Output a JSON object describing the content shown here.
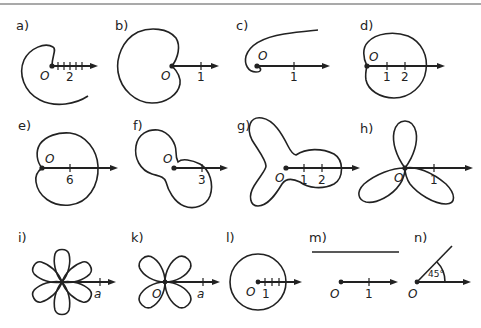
{
  "figure": {
    "panels": [
      {
        "id": "a",
        "label": "a)",
        "origin": "O",
        "ticks": [
          "2"
        ],
        "curve": "Archimedean spiral"
      },
      {
        "id": "b",
        "label": "b)",
        "origin": "O",
        "ticks": [
          "1"
        ],
        "curve": "cardioid"
      },
      {
        "id": "c",
        "label": "c)",
        "origin": "O",
        "ticks": [
          "1"
        ],
        "curve": "hyperbolic spiral"
      },
      {
        "id": "d",
        "label": "d)",
        "origin": "O",
        "ticks": [
          "1",
          "2"
        ],
        "curve": "limacon"
      },
      {
        "id": "e",
        "label": "e)",
        "origin": "O",
        "ticks": [
          "6"
        ],
        "curve": "cardioid-like oval"
      },
      {
        "id": "f",
        "label": "f)",
        "origin": "O",
        "ticks": [
          "3"
        ],
        "curve": "peanut curve"
      },
      {
        "id": "g",
        "label": "g)",
        "origin": "O",
        "ticks": [
          "1",
          "2"
        ],
        "curve": "three-lobed curve"
      },
      {
        "id": "h",
        "label": "h)",
        "origin": "O",
        "ticks": [
          "1"
        ],
        "curve": "three-leaved rose"
      },
      {
        "id": "i",
        "label": "i)",
        "origin": "",
        "ticks": [
          "a"
        ],
        "curve": "six-leaved rose"
      },
      {
        "id": "k",
        "label": "k)",
        "origin": "O",
        "ticks": [
          "a"
        ],
        "curve": "four-leaved rose"
      },
      {
        "id": "l",
        "label": "l)",
        "origin": "O",
        "ticks": [
          "1"
        ],
        "curve": "circle centered at origin"
      },
      {
        "id": "m",
        "label": "m)",
        "origin": "O",
        "ticks": [
          "1"
        ],
        "curve": "horizontal line"
      },
      {
        "id": "n",
        "label": "n)",
        "origin": "O",
        "ticks": [],
        "angle": "45°",
        "curve": "ray at 45 degrees"
      }
    ]
  },
  "labels": {
    "a": "a)",
    "b": "b)",
    "c": "c)",
    "d": "d)",
    "e": "e)",
    "f": "f)",
    "g": "g)",
    "h": "h)",
    "i": "i)",
    "k": "k)",
    "l": "l)",
    "m": "m)",
    "n": "n)",
    "origin": "O",
    "tick_1": "1",
    "tick_2": "2",
    "tick_3": "3",
    "tick_6": "6",
    "tick_a": "a",
    "angle_45": "45°"
  },
  "colors": {
    "ink": "#222222",
    "background": "#ffffff"
  }
}
